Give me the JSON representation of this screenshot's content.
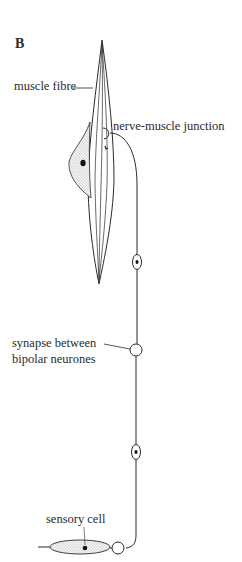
{
  "figure": {
    "panel_label": "B",
    "labels": {
      "muscle_fibre": "muscle fibre",
      "nerve_muscle_junction": "nerve-muscle junction",
      "synapse_line1": "synapse between",
      "synapse_line2": "bipolar neurones",
      "sensory_cell": "sensory cell"
    },
    "colors": {
      "ink": "#2a2a2a",
      "stipple": "#b8b8b8",
      "background": "#ffffff"
    }
  }
}
